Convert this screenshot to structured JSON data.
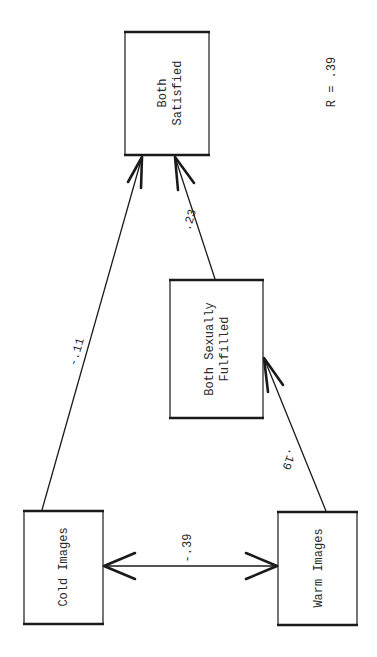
{
  "diagram": {
    "type": "path diagram",
    "orientation": "rotated 90 degrees clockwise",
    "stat": {
      "label": "R = .39"
    },
    "nodes": {
      "both_satisfied": {
        "line1": "Both",
        "line2": "Satisfied"
      },
      "both_sexually_fulfilled": {
        "line1": "Both Sexually",
        "line2": "Fulfilled"
      },
      "cold_images": {
        "label": "Cold Images"
      },
      "warm_images": {
        "label": "Warm Images"
      }
    },
    "edges": {
      "cold_to_satisfied": {
        "from": "Cold Images",
        "to": "Both Satisfied",
        "coefficient": "-.11",
        "direction": "one-way"
      },
      "fulfilled_to_satisfied": {
        "from": "Both Sexually Fulfilled",
        "to": "Both Satisfied",
        "coefficient": ".23",
        "direction": "one-way"
      },
      "warm_to_fulfilled": {
        "from": "Warm Images",
        "to": "Both Sexually Fulfilled",
        "coefficient": ".19",
        "direction": "one-way"
      },
      "cold_warm": {
        "from": "Cold Images",
        "to": "Warm Images",
        "coefficient": "-.39",
        "direction": "two-way"
      }
    },
    "colors": {
      "ink": "#1a1a1a",
      "background": "#ffffff"
    }
  }
}
